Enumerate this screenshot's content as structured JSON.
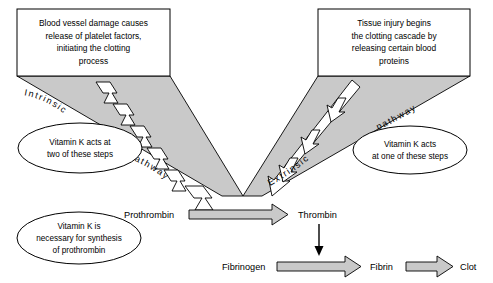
{
  "diagram": {
    "background_color": "#ffffff",
    "funnel_fill": "#c9c9c9",
    "arrow_fill": "#c9c9c9",
    "outline_color": "#000000"
  },
  "boxes": {
    "intrinsic_box": {
      "name": "intrinsic-trigger-box",
      "lines": [
        "Blood vessel damage causes",
        "release of platelet factors,",
        "initiating the clotting",
        "process"
      ]
    },
    "extrinsic_box": {
      "name": "extrinsic-trigger-box",
      "lines": [
        "Tissue injury begins",
        "the clotting cascade by",
        "releasing certain blood",
        "proteins"
      ]
    }
  },
  "ellipses": {
    "intrinsic_note": {
      "lines": [
        "Vitamin K acts at",
        "two of these steps"
      ]
    },
    "extrinsic_note": {
      "lines": [
        "Vitamin K acts",
        "at one of these steps"
      ]
    },
    "prothrombin_note": {
      "lines": [
        "Vitamin K is",
        "necessary for synthesis",
        "of prothrombin"
      ]
    }
  },
  "pathway_labels": {
    "intrinsic_name": "Intrinsic",
    "intrinsic_word": "pathway",
    "extrinsic_name": "Extrinsic",
    "extrinsic_word": "pathway"
  },
  "chain": {
    "prothrombin": "Prothrombin",
    "thrombin": "Thrombin",
    "fibrinogen": "Fibrinogen",
    "fibrin": "Fibrin",
    "clot": "Clot"
  }
}
